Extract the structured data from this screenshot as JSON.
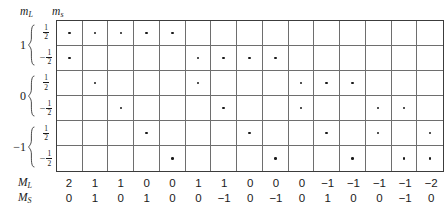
{
  "figure": {
    "type": "microstate-table"
  },
  "header": {
    "ml_label": "m",
    "ml_sub": "L",
    "ms_label": "m",
    "ms_sub": "s"
  },
  "axis": {
    "groups": [
      {
        "ml": "1",
        "spins": [
          {
            "sign": "",
            "num": "1",
            "den": "2"
          },
          {
            "sign": "−",
            "num": "1",
            "den": "2"
          }
        ]
      },
      {
        "ml": "0",
        "spins": [
          {
            "sign": "",
            "num": "1",
            "den": "2"
          },
          {
            "sign": "−",
            "num": "1",
            "den": "2"
          }
        ]
      },
      {
        "ml": "−1",
        "spins": [
          {
            "sign": "",
            "num": "1",
            "den": "2"
          },
          {
            "sign": "−",
            "num": "1",
            "den": "2"
          }
        ]
      }
    ]
  },
  "footer": {
    "ML_label": "M",
    "ML_sub": "L",
    "MS_label": "M",
    "MS_sub": "S"
  },
  "chart_data": {
    "type": "table",
    "xlabel": "microstate (column)",
    "ylabel": "spin-orbital (m_L, m_s)",
    "grid": true,
    "n_columns": 15,
    "n_rows": 6,
    "row_labels": [
      "m_L=1, m_s=+1/2",
      "m_L=1, m_s=-1/2",
      "m_L=0, m_s=+1/2",
      "m_L=0, m_s=-1/2",
      "m_L=-1, m_s=+1/2",
      "m_L=-1, m_s=-1/2"
    ],
    "occupancy": [
      [
        1,
        1,
        1,
        1,
        1,
        0,
        0,
        0,
        0,
        0,
        0,
        0,
        0,
        0,
        0
      ],
      [
        1,
        0,
        0,
        0,
        0,
        1,
        1,
        1,
        1,
        0,
        0,
        0,
        0,
        0,
        0
      ],
      [
        0,
        1,
        0,
        0,
        0,
        1,
        0,
        0,
        0,
        1,
        1,
        1,
        0,
        0,
        0
      ],
      [
        0,
        0,
        1,
        0,
        0,
        0,
        1,
        0,
        0,
        1,
        0,
        0,
        1,
        1,
        0
      ],
      [
        0,
        0,
        0,
        1,
        0,
        0,
        0,
        1,
        0,
        0,
        1,
        0,
        1,
        0,
        1
      ],
      [
        0,
        0,
        0,
        0,
        1,
        0,
        0,
        0,
        1,
        0,
        0,
        1,
        0,
        1,
        1
      ]
    ],
    "categories": [
      "1",
      "2",
      "3",
      "4",
      "5",
      "6",
      "7",
      "8",
      "9",
      "10",
      "11",
      "12",
      "13",
      "14",
      "15"
    ],
    "series": [
      {
        "name": "M_L",
        "values": [
          "2",
          "1",
          "1",
          "0",
          "0",
          "1",
          "1",
          "0",
          "0",
          "0",
          "−1",
          "−1",
          "−1",
          "−1",
          "−2"
        ]
      },
      {
        "name": "M_S",
        "values": [
          "0",
          "1",
          "0",
          "1",
          "0",
          "0",
          "−1",
          "0",
          "−1",
          "0",
          "1",
          "0",
          "0",
          "−1",
          "0"
        ]
      }
    ]
  }
}
